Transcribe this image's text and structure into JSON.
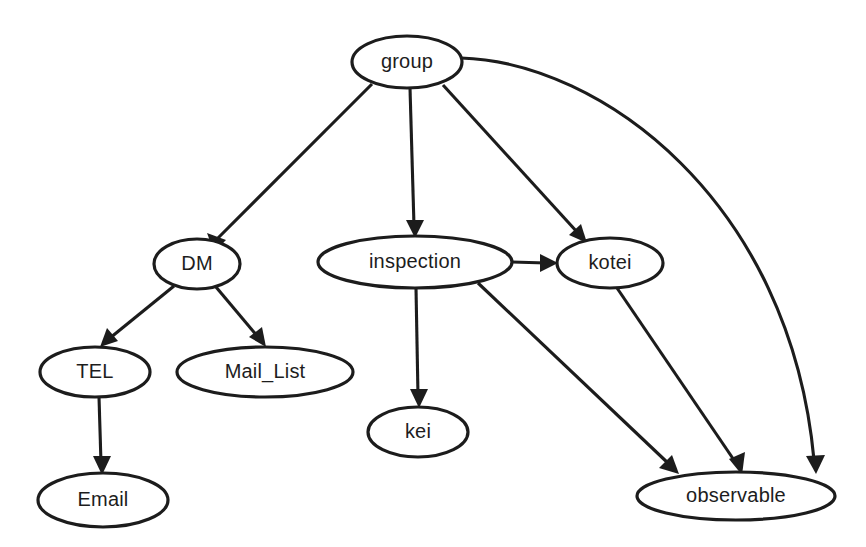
{
  "diagram": {
    "type": "directed-graph",
    "background_color": "#ffffff",
    "node_fill": "#ffffff",
    "node_stroke": "#1c1c1c",
    "edge_color": "#1c1c1c",
    "label_color": "#1d1d1d",
    "nodes": [
      {
        "id": "group",
        "label": "group",
        "cx": 407,
        "cy": 62,
        "rx": 55,
        "ry": 26
      },
      {
        "id": "DM",
        "label": "DM",
        "cx": 197,
        "cy": 264,
        "rx": 43,
        "ry": 25
      },
      {
        "id": "inspection",
        "label": "inspection",
        "cx": 415,
        "cy": 262,
        "rx": 97,
        "ry": 26
      },
      {
        "id": "kotei",
        "label": "kotei",
        "cx": 610,
        "cy": 263,
        "rx": 53,
        "ry": 25
      },
      {
        "id": "TEL",
        "label": "TEL",
        "cx": 95,
        "cy": 372,
        "rx": 55,
        "ry": 25
      },
      {
        "id": "Mail_List",
        "label": "Mail_List",
        "cx": 265,
        "cy": 372,
        "rx": 88,
        "ry": 25
      },
      {
        "id": "kei",
        "label": "kei",
        "cx": 418,
        "cy": 432,
        "rx": 50,
        "ry": 25
      },
      {
        "id": "Email",
        "label": "Email",
        "cx": 103,
        "cy": 500,
        "rx": 65,
        "ry": 27
      },
      {
        "id": "observable",
        "label": "observable",
        "cx": 736,
        "cy": 496,
        "rx": 99,
        "ry": 24
      }
    ],
    "edges": [
      {
        "from": "group",
        "to": "DM",
        "shape": "straight"
      },
      {
        "from": "group",
        "to": "inspection",
        "shape": "straight"
      },
      {
        "from": "group",
        "to": "kotei",
        "shape": "straight"
      },
      {
        "from": "group",
        "to": "observable",
        "shape": "curved-right"
      },
      {
        "from": "DM",
        "to": "TEL",
        "shape": "straight"
      },
      {
        "from": "DM",
        "to": "Mail_List",
        "shape": "straight"
      },
      {
        "from": "TEL",
        "to": "Email",
        "shape": "straight"
      },
      {
        "from": "inspection",
        "to": "kotei",
        "shape": "straight"
      },
      {
        "from": "inspection",
        "to": "kei",
        "shape": "straight"
      },
      {
        "from": "inspection",
        "to": "observable",
        "shape": "straight"
      },
      {
        "from": "kotei",
        "to": "observable",
        "shape": "straight"
      }
    ]
  }
}
